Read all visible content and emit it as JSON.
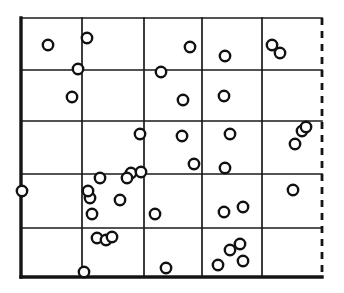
{
  "figure": {
    "style": "hand-drawn ink on white"
  },
  "colors": {
    "background": "#ffffff",
    "ink": "#111111",
    "grid": "#1a1a1a",
    "boundary": "#141414",
    "point_fill": "#ffffff"
  },
  "chart_data": {
    "type": "scatter",
    "title": "",
    "xlabel": "",
    "ylabel": "",
    "xlim": [
      21,
      322
    ],
    "ylim": [
      18,
      277
    ],
    "grid": true,
    "legend": false,
    "point_marker": "open-circle",
    "point_radius": 5.2,
    "grid_lines": {
      "vertical": [
        21,
        82,
        144,
        202,
        262,
        322
      ],
      "horizontal": [
        18,
        70,
        121,
        174,
        228,
        277
      ],
      "columns": 5,
      "rows": 5
    },
    "boundary": {
      "left": {
        "x": 21,
        "style": "solid",
        "weight": "thick"
      },
      "top": {
        "y": 18,
        "style": "solid",
        "weight": "thin"
      },
      "right": {
        "x": 322,
        "style": "dashed",
        "weight": "medium"
      },
      "bottom": {
        "y": 277,
        "style": "solid",
        "weight": "thick"
      }
    },
    "point_count": 41,
    "points": [
      {
        "x": 48,
        "y": 45
      },
      {
        "x": 87,
        "y": 38
      },
      {
        "x": 78,
        "y": 69
      },
      {
        "x": 72,
        "y": 97
      },
      {
        "x": 161,
        "y": 72
      },
      {
        "x": 190,
        "y": 47
      },
      {
        "x": 225,
        "y": 56
      },
      {
        "x": 224,
        "y": 96
      },
      {
        "x": 272,
        "y": 45
      },
      {
        "x": 280,
        "y": 53
      },
      {
        "x": 140,
        "y": 134
      },
      {
        "x": 182,
        "y": 136
      },
      {
        "x": 230,
        "y": 134
      },
      {
        "x": 194,
        "y": 164
      },
      {
        "x": 225,
        "y": 168
      },
      {
        "x": 302,
        "y": 131
      },
      {
        "x": 295,
        "y": 144
      },
      {
        "x": 100,
        "y": 178
      },
      {
        "x": 131,
        "y": 173
      },
      {
        "x": 141,
        "y": 172
      },
      {
        "x": 22,
        "y": 191
      },
      {
        "x": 90,
        "y": 198
      },
      {
        "x": 120,
        "y": 200
      },
      {
        "x": 92,
        "y": 214
      },
      {
        "x": 155,
        "y": 214
      },
      {
        "x": 293,
        "y": 190
      },
      {
        "x": 97,
        "y": 238
      },
      {
        "x": 106,
        "y": 240
      },
      {
        "x": 224,
        "y": 212
      },
      {
        "x": 243,
        "y": 207
      },
      {
        "x": 240,
        "y": 244
      },
      {
        "x": 243,
        "y": 261
      },
      {
        "x": 218,
        "y": 265
      },
      {
        "x": 166,
        "y": 268
      },
      {
        "x": 84,
        "y": 272
      },
      {
        "x": 306,
        "y": 127
      },
      {
        "x": 183,
        "y": 100
      },
      {
        "x": 127,
        "y": 178
      },
      {
        "x": 88,
        "y": 191
      },
      {
        "x": 112,
        "y": 237
      },
      {
        "x": 230,
        "y": 250
      }
    ]
  }
}
